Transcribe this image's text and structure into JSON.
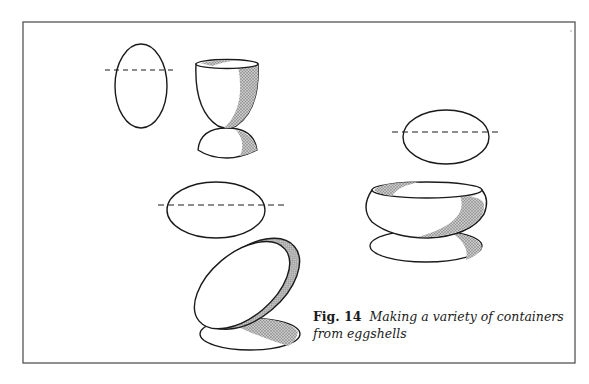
{
  "figure": {
    "label": "Fig. 14",
    "caption": "Making a variety of containers from eggshells",
    "colors": {
      "frame": "#555555",
      "ink": "#1a1a1a",
      "shade": "#9a9a9a",
      "background": "#ffffff"
    },
    "items": [
      {
        "name": "upright-egg-with-cut-line",
        "description": "Whole egg, upright, dashed cut line near top"
      },
      {
        "name": "egg-cup",
        "description": "Egg cup made from cut eggshell on domed base"
      },
      {
        "name": "horizontal-egg-with-cut-line",
        "description": "Whole egg, horizontal, dashed cut line along middle"
      },
      {
        "name": "tilted-dish",
        "description": "Shallow dish made from eggshell half, tilted on oval base"
      },
      {
        "name": "sideways-egg-with-cut-line",
        "description": "Whole egg on its side, dashed cut line above middle"
      },
      {
        "name": "bowl",
        "description": "Rounded bowl made from eggshell on oval base"
      }
    ]
  }
}
